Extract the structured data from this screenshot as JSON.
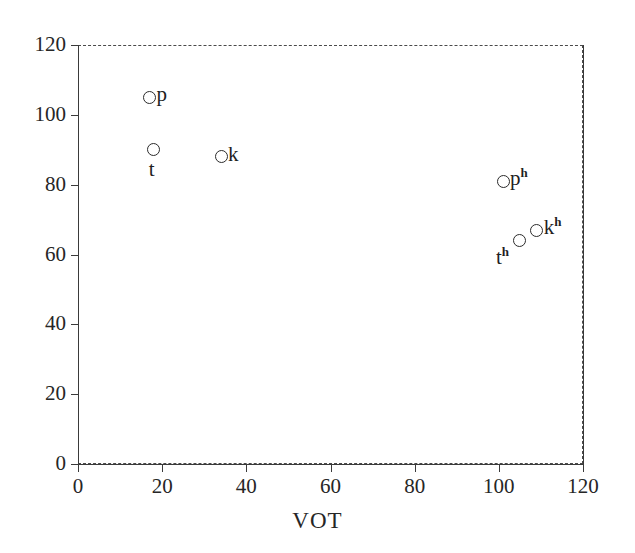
{
  "chart_data": {
    "type": "scatter",
    "title": "",
    "subtitle": "",
    "xlabel": "VOT",
    "ylabel": "",
    "xlim": [
      0,
      120
    ],
    "ylim": [
      0,
      120
    ],
    "xticks": [
      0,
      20,
      40,
      60,
      80,
      100,
      120
    ],
    "yticks": [
      0,
      20,
      40,
      60,
      80,
      100,
      120
    ],
    "xticklabels": [
      "0",
      "20",
      "40",
      "60",
      "80",
      "100",
      "120"
    ],
    "yticklabels": [
      "0",
      "20",
      "40",
      "60",
      "80",
      "100",
      "120"
    ],
    "grid": false,
    "frame": "dashed",
    "legend": "none",
    "marker": "open-circle",
    "points": [
      {
        "label": "p",
        "label_html": "p",
        "x": 17,
        "y": 105,
        "label_pos": "right"
      },
      {
        "label": "t",
        "label_html": "t",
        "x": 18,
        "y": 90,
        "label_pos": "below"
      },
      {
        "label": "k",
        "label_html": "k",
        "x": 34,
        "y": 88,
        "label_pos": "right"
      },
      {
        "label": "ph",
        "label_html": "p<sup>h</sup>",
        "x": 101,
        "y": 81,
        "label_pos": "right"
      },
      {
        "label": "th",
        "label_html": "t<sup>h</sup>",
        "x": 105,
        "y": 64,
        "label_pos": "below-left"
      },
      {
        "label": "kh",
        "label_html": "k<sup>h</sup>",
        "x": 109,
        "y": 67,
        "label_pos": "right"
      }
    ]
  },
  "axes": {
    "x_title": "VOT"
  }
}
